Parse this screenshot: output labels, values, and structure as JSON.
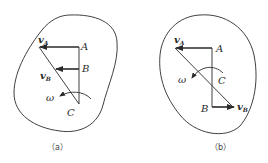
{
  "figures": [
    {
      "id": "a",
      "caption": "（a）",
      "points": {
        "A": "A",
        "B": "B",
        "C": "C"
      },
      "vectors": {
        "vA": {
          "base": "v",
          "sub": "A"
        },
        "vB": {
          "base": "v",
          "sub": "B"
        }
      },
      "angular_velocity": "ω"
    },
    {
      "id": "b",
      "caption": "（b）",
      "points": {
        "A": "A",
        "B": "B",
        "C": "C"
      },
      "vectors": {
        "vA": {
          "base": "v",
          "sub": "A"
        },
        "vB": {
          "base": "v",
          "sub": "B"
        }
      },
      "angular_velocity": "ω"
    }
  ],
  "colors": {
    "stroke": "#2a2a2a",
    "background": "#ffffff"
  }
}
